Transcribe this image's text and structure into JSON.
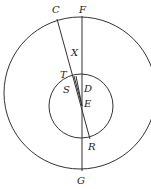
{
  "diagram": {
    "type": "geometry",
    "outer_circle": {
      "cx": 80,
      "cy": 93,
      "r": 76
    },
    "inner_circle": {
      "cx": 81,
      "cy": 106,
      "r": 32
    },
    "labels": {
      "C": "C",
      "F": "F",
      "X": "X",
      "T": "T",
      "S": "S",
      "D": "D",
      "E": "E",
      "R": "R",
      "G": "G"
    },
    "colors": {
      "line": "#333333",
      "text": "#222222",
      "background": "#ffffff"
    }
  }
}
